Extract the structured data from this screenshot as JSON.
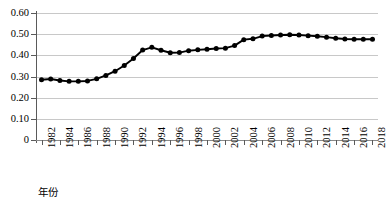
{
  "chart_data": {
    "type": "line",
    "title": "",
    "xlabel": "年份",
    "ylabel": "",
    "grid": true,
    "legend": false,
    "marker": "filled-circle",
    "line_color": "#000000",
    "marker_color": "#000000",
    "grid_color": "#c8c8c8",
    "xlim": [
      1981.4,
      2018.6
    ],
    "ylim": [
      0,
      0.6
    ],
    "ytick_values": [
      0,
      0.1,
      0.2,
      0.3,
      0.4,
      0.5,
      0.6
    ],
    "ytick_labels": [
      "0",
      "0.10",
      "0.20",
      "0.30",
      "0.40",
      "0.50",
      "0.60"
    ],
    "xtick_values": [
      1982,
      1984,
      1986,
      1988,
      1990,
      1992,
      1994,
      1996,
      1998,
      2000,
      2002,
      2004,
      2006,
      2008,
      2010,
      2012,
      2014,
      2016,
      2018
    ],
    "xtick_labels": [
      "1982",
      "1984",
      "1986",
      "1988",
      "1990",
      "1992",
      "1994",
      "1996",
      "1998",
      "2000",
      "2002",
      "2004",
      "2006",
      "2008",
      "2010",
      "2012",
      "2014",
      "2016",
      "2018"
    ],
    "x": [
      1982,
      1983,
      1984,
      1985,
      1986,
      1987,
      1988,
      1989,
      1990,
      1991,
      1992,
      1993,
      1994,
      1995,
      1996,
      1997,
      1998,
      1999,
      2000,
      2001,
      2002,
      2003,
      2004,
      2005,
      2006,
      2007,
      2008,
      2009,
      2010,
      2011,
      2012,
      2013,
      2014,
      2015,
      2016,
      2017,
      2018
    ],
    "values": [
      0.285,
      0.288,
      0.281,
      0.277,
      0.277,
      0.279,
      0.289,
      0.305,
      0.325,
      0.352,
      0.385,
      0.425,
      0.438,
      0.424,
      0.412,
      0.413,
      0.422,
      0.426,
      0.429,
      0.432,
      0.434,
      0.446,
      0.474,
      0.478,
      0.491,
      0.494,
      0.496,
      0.497,
      0.496,
      0.493,
      0.49,
      0.486,
      0.481,
      0.477,
      0.476,
      0.476,
      0.476
    ]
  }
}
